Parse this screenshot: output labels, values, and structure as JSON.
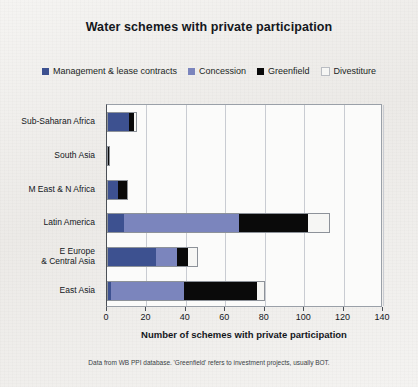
{
  "chart_data": {
    "type": "bar",
    "orientation": "horizontal",
    "stacked": true,
    "title": "Water schemes with private participation",
    "xlabel": "Number of schemes with private participation",
    "ylabel": "",
    "xlim": [
      0,
      140
    ],
    "xticks": [
      0,
      20,
      40,
      60,
      80,
      100,
      120,
      140
    ],
    "grid": "vertical",
    "legend_position": "top-center",
    "footnote": "Data from WB PPI database. 'Greenfield' refers to investment projects, usually BOT.",
    "categories": [
      "Sub-Saharan Africa",
      "South Asia",
      "M East & N Africa",
      "Latin America",
      "E Europe\n& Central Asia",
      "East Asia"
    ],
    "series": [
      {
        "name": "Management & lease contracts",
        "color": "#3d5190",
        "values": [
          11,
          0,
          5.5,
          8.5,
          25,
          2
        ]
      },
      {
        "name": "Concession",
        "color": "#7b85bd",
        "values": [
          0,
          0,
          0,
          58.5,
          10.5,
          37
        ]
      },
      {
        "name": "Greenfield",
        "color": "#0a0a0a",
        "values": [
          2.5,
          1.5,
          4.5,
          35,
          5.5,
          37
        ]
      },
      {
        "name": "Divestiture",
        "color": "#f6f6f4",
        "values": [
          1.5,
          0,
          0.5,
          11,
          5,
          4
        ]
      }
    ],
    "totals": [
      15,
      1.5,
      10.5,
      113,
      46,
      80
    ]
  }
}
